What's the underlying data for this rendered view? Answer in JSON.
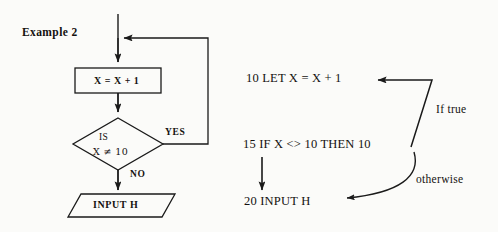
{
  "figure": {
    "caption": "Example 2",
    "flowchart": {
      "process_box": {
        "label": "X = X + 1"
      },
      "decision": {
        "line1": "IS",
        "line2": "X ≠ 10"
      },
      "branch_yes": "YES",
      "branch_no": "NO",
      "io_box": {
        "label": "INPUT H"
      }
    },
    "code": {
      "lines": [
        {
          "number": "10",
          "text": "10 LET X = X + 1"
        },
        {
          "number": "15",
          "text": "15 IF X <> 10 THEN 10"
        },
        {
          "number": "20",
          "text": "20 INPUT H"
        }
      ],
      "annotation_true": "If true",
      "annotation_false": "otherwise"
    },
    "colors": {
      "ink": "#14110f",
      "paper": "#fbfbf9",
      "stroke": "#1a1a1a"
    }
  }
}
